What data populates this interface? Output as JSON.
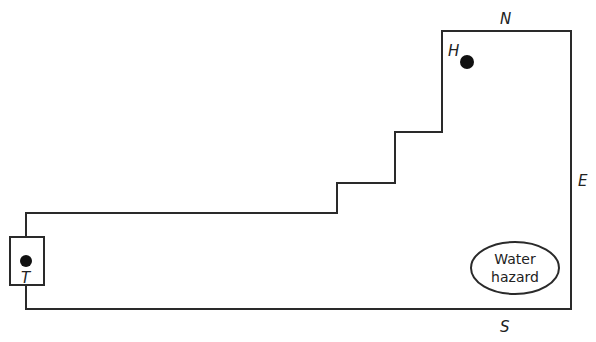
{
  "diagram": {
    "compass": {
      "north": "N",
      "east": "E",
      "south": "S"
    },
    "markers": {
      "tee": {
        "label": "T"
      },
      "hole": {
        "label": "H"
      }
    },
    "hazard": {
      "line1": "Water",
      "line2": "hazard"
    },
    "colors": {
      "stroke": "#2a2a2a",
      "background": "#ffffff"
    }
  }
}
